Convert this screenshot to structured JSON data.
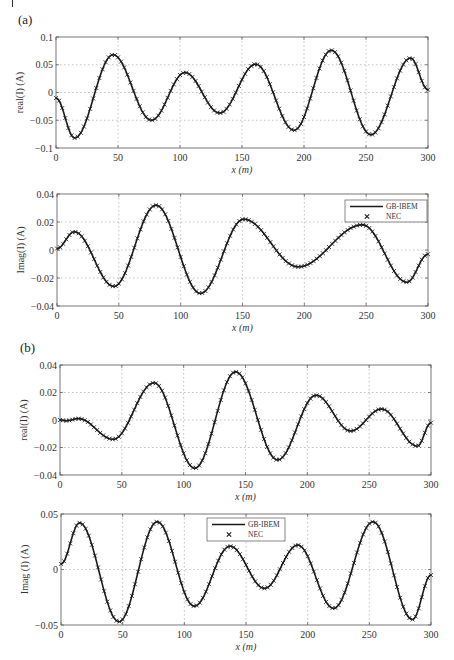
{
  "figure": {
    "panel_labels": [
      "(a)",
      "(b)"
    ],
    "legend_labels": {
      "line": "GB-IBEM",
      "marker": "NEC"
    },
    "x_label": "x (m)",
    "colors": {
      "curve": "#1a1a1a",
      "grid": "#9a9a9a",
      "axes": "#555555",
      "background": "#ffffff"
    }
  },
  "chart_data": [
    {
      "type": "line",
      "panel": "(a)",
      "title": "",
      "xlabel": "x (m)",
      "ylabel": "real(I) (A)",
      "xlim": [
        0,
        300
      ],
      "ylim": [
        -0.1,
        0.1
      ],
      "xticks": [
        0,
        50,
        100,
        150,
        200,
        250,
        300
      ],
      "yticks": [
        -0.1,
        -0.05,
        0,
        0.05,
        0.1
      ],
      "ytick_labels": [
        "-0.1",
        "-0.05",
        "0",
        "0.05",
        "0.1"
      ],
      "grid": true,
      "legend": null,
      "series": [
        {
          "name": "GB-IBEM / NEC",
          "x": [
            0,
            15,
            46,
            77,
            104,
            132,
            161,
            192,
            222,
            254,
            286,
            300
          ],
          "y": [
            -0.01,
            -0.082,
            0.068,
            -0.05,
            0.036,
            -0.037,
            0.051,
            -0.068,
            0.076,
            -0.076,
            0.062,
            0.005
          ]
        }
      ]
    },
    {
      "type": "line",
      "panel": "(a)",
      "title": "",
      "xlabel": "x (m)",
      "ylabel": "Imag(I) (A)",
      "xlim": [
        0,
        300
      ],
      "ylim": [
        -0.04,
        0.04
      ],
      "xticks": [
        0,
        50,
        100,
        150,
        200,
        250,
        300
      ],
      "yticks": [
        -0.04,
        -0.02,
        0,
        0.02,
        0.04
      ],
      "ytick_labels": [
        "-0.04",
        "-0.02",
        "0",
        "0.02",
        "0.04"
      ],
      "grid": true,
      "legend": {
        "position": "upper right",
        "entries": [
          "GB-IBEM",
          "NEC"
        ]
      },
      "series": [
        {
          "name": "GB-IBEM / NEC",
          "x": [
            0,
            14,
            46,
            80,
            116,
            151,
            195,
            247,
            283,
            300
          ],
          "y": [
            0.001,
            0.013,
            -0.026,
            0.032,
            -0.031,
            0.022,
            -0.012,
            0.018,
            -0.023,
            -0.003
          ]
        }
      ]
    },
    {
      "type": "line",
      "panel": "(b)",
      "title": "",
      "xlabel": "x (m)",
      "ylabel": "real(I) (A)",
      "xlim": [
        0,
        300
      ],
      "ylim": [
        -0.04,
        0.04
      ],
      "xticks": [
        0,
        50,
        100,
        150,
        200,
        250,
        300
      ],
      "yticks": [
        -0.04,
        -0.02,
        0,
        0.02,
        0.04
      ],
      "ytick_labels": [
        "-0.04",
        "-0.02",
        "0",
        "0.02",
        "0.04"
      ],
      "grid": true,
      "legend": null,
      "series": [
        {
          "name": "GB-IBEM / NEC",
          "x": [
            0,
            5,
            15,
            43,
            76,
            109,
            142,
            176,
            207,
            235,
            260,
            289,
            300
          ],
          "y": [
            0.0,
            -0.0005,
            0.001,
            -0.014,
            0.027,
            -0.035,
            0.035,
            -0.029,
            0.018,
            -0.008,
            0.008,
            -0.019,
            -0.002
          ]
        }
      ]
    },
    {
      "type": "line",
      "panel": "(b)",
      "title": "",
      "xlabel": "x (m)",
      "ylabel": "Imag (I) (A)",
      "xlim": [
        0,
        300
      ],
      "ylim": [
        -0.05,
        0.05
      ],
      "xticks": [
        0,
        50,
        100,
        150,
        200,
        250,
        300
      ],
      "yticks": [
        -0.05,
        0,
        0.05
      ],
      "ytick_labels": [
        "-0.05",
        "0",
        "0.05"
      ],
      "grid": true,
      "legend": {
        "position": "upper center",
        "entries": [
          "GB-IBEM",
          "NEC"
        ]
      },
      "series": [
        {
          "name": "GB-IBEM / NEC",
          "x": [
            0,
            15,
            47,
            78,
            108,
            137,
            165,
            192,
            221,
            253,
            285,
            300
          ],
          "y": [
            0.005,
            0.042,
            -0.047,
            0.043,
            -0.033,
            0.021,
            -0.017,
            0.022,
            -0.035,
            0.043,
            -0.045,
            -0.005
          ]
        }
      ]
    }
  ]
}
